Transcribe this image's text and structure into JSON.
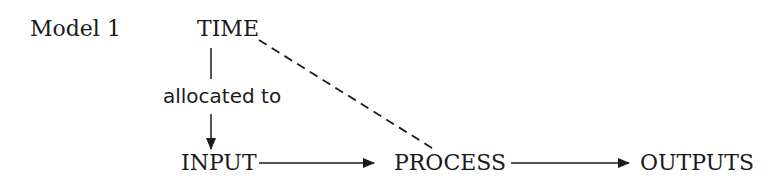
{
  "diagram": {
    "title": "Model 1",
    "nodes": {
      "time": "TIME",
      "input": "INPUT",
      "process": "PROCESS",
      "outputs": "OUTPUTS"
    },
    "edge_labels": {
      "time_to_input": "allocated to"
    },
    "edges": [
      {
        "from": "TIME",
        "to": "INPUT",
        "style": "solid",
        "label": "allocated to",
        "arrow": true
      },
      {
        "from": "INPUT",
        "to": "PROCESS",
        "style": "solid",
        "arrow": true
      },
      {
        "from": "PROCESS",
        "to": "OUTPUTS",
        "style": "solid",
        "arrow": true
      },
      {
        "from": "TIME",
        "to": "PROCESS",
        "style": "dashed",
        "arrow": false
      }
    ],
    "colors": {
      "ink": "#1a1a1a",
      "background": "#ffffff"
    }
  }
}
